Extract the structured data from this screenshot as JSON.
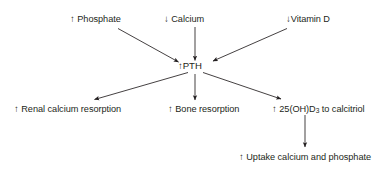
{
  "diagram": {
    "background_color": "#ffffff",
    "stroke_color": "#231f20",
    "text_color": "#231f20",
    "nodes": {
      "phosphate": {
        "arrow": "↑",
        "gap": " ",
        "text": "Phosphate"
      },
      "calcium": {
        "arrow": "↓",
        "gap": " ",
        "text": "Calcium"
      },
      "vitamin_d": {
        "arrow": "↓",
        "gap": "",
        "text": "Vitamin D"
      },
      "pth": {
        "arrow": "↑",
        "gap": "",
        "text": "PTH"
      },
      "renal_calcium_resorption": {
        "arrow": "↑",
        "gap": " ",
        "text": "Renal calcium resorption"
      },
      "bone_resorption": {
        "arrow": "↑",
        "gap": " ",
        "text": "Bone resorption"
      },
      "calcitriol": {
        "arrow": "↑",
        "gap": " ",
        "pre": "25(OH)D",
        "sub": "3",
        "post": " to calcitriol"
      },
      "uptake": {
        "arrow": "↑",
        "gap": " ",
        "text": "Uptake calcium and phosphate"
      }
    }
  }
}
